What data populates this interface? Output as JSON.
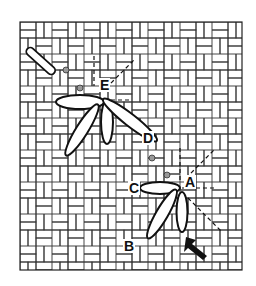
{
  "diagram": {
    "type": "needlework-stitch-diagram",
    "colors": {
      "ink": "#111111",
      "background": "#ffffff",
      "grid": "#333333"
    },
    "canvas": {
      "left": 20,
      "top": 22,
      "right": 242,
      "bottom": 270,
      "cell": 8
    },
    "labels": [
      {
        "id": "A",
        "text": "A",
        "x": 164,
        "y": 172
      },
      {
        "id": "B",
        "text": "B",
        "x": 128,
        "y": 238
      },
      {
        "id": "C",
        "text": "C",
        "x": 124,
        "y": 180
      },
      {
        "id": "D",
        "text": "D",
        "x": 142,
        "y": 128
      },
      {
        "id": "E",
        "text": "E",
        "x": 96,
        "y": 82
      }
    ],
    "arrow": {
      "name": "needle-direction-arrow",
      "x": 190,
      "y": 248
    }
  }
}
